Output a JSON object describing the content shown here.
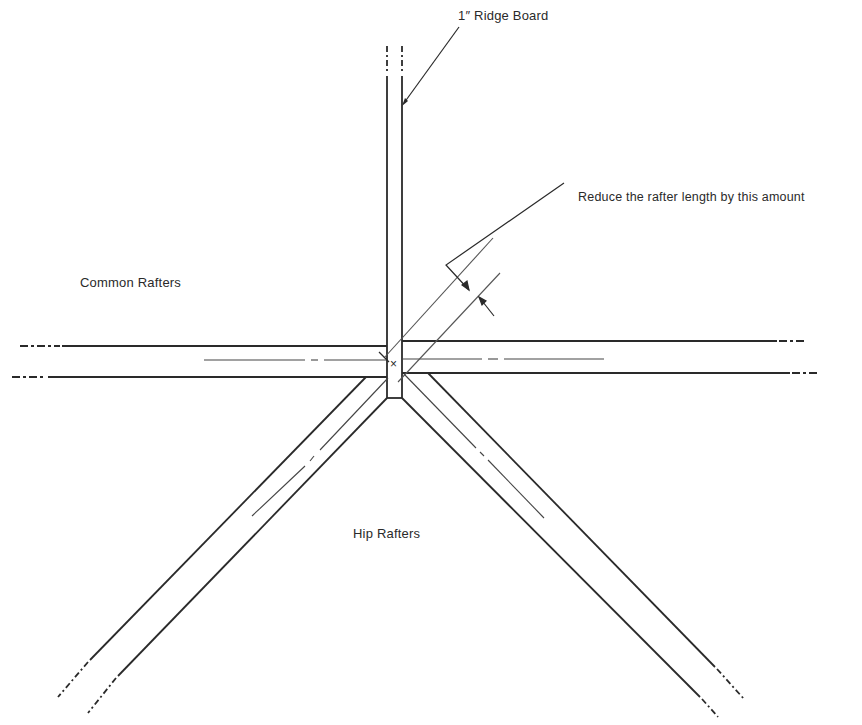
{
  "diagram": {
    "type": "roof framing plan detail",
    "labels": {
      "ridge_board": "1″ Ridge Board",
      "reduce_note": "Reduce the rafter length by this amount",
      "common_rafters": "Common Rafters",
      "hip_rafters": "Hip Rafters"
    },
    "symbols": {
      "center_mark": "×"
    },
    "colors": {
      "line": "#2a2a2a",
      "thin_line": "#555555",
      "background": "#ffffff"
    }
  }
}
